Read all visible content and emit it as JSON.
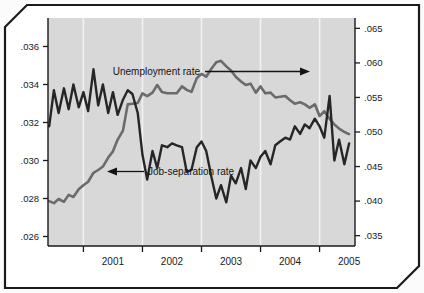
{
  "chart_data": {
    "type": "line",
    "title": "",
    "xlabel": "",
    "ylabel": "",
    "grid": "vertical-only",
    "legend_position": "inline-annotations",
    "x_axis": {
      "tick_labels": [
        "2001",
        "2002",
        "2003",
        "2004",
        "2005"
      ],
      "range_start": "2000.4",
      "range_end": "2005.6"
    },
    "left_axis": {
      "label": "Job-separation rate",
      "tick_labels": [
        ".026",
        ".028",
        ".030",
        ".032",
        ".034",
        ".036"
      ],
      "ylim": [
        0.0255,
        0.0375
      ]
    },
    "right_axis": {
      "label": "Unemployment rate",
      "tick_labels": [
        ".035",
        ".040",
        ".045",
        ".050",
        ".055",
        ".060",
        ".065"
      ],
      "ylim": [
        0.0335,
        0.0665
      ]
    },
    "annotations": [
      {
        "text": "Unemployment rate",
        "arrow": "right"
      },
      {
        "text": "Job-separation rate",
        "arrow": "left"
      }
    ],
    "series": [
      {
        "name": "Unemployment rate",
        "axis": "right",
        "color": "#6b6b6b",
        "x": [
          2000.42,
          2000.5,
          2000.58,
          2000.67,
          2000.75,
          2000.83,
          2000.92,
          2001.0,
          2001.08,
          2001.17,
          2001.25,
          2001.33,
          2001.42,
          2001.5,
          2001.58,
          2001.67,
          2001.75,
          2001.83,
          2001.92,
          2002.0,
          2002.08,
          2002.17,
          2002.25,
          2002.33,
          2002.42,
          2002.5,
          2002.58,
          2002.67,
          2002.75,
          2002.83,
          2002.92,
          2003.0,
          2003.08,
          2003.17,
          2003.25,
          2003.33,
          2003.42,
          2003.5,
          2003.58,
          2003.67,
          2003.75,
          2003.83,
          2003.92,
          2004.0,
          2004.08,
          2004.17,
          2004.25,
          2004.33,
          2004.42,
          2004.5,
          2004.58,
          2004.67,
          2004.75,
          2004.83,
          2004.92,
          2005.0,
          2005.08,
          2005.17,
          2005.25,
          2005.33,
          2005.42,
          2005.5
        ],
        "values": [
          0.04,
          0.0397,
          0.0403,
          0.0399,
          0.0409,
          0.0406,
          0.0417,
          0.0423,
          0.0428,
          0.0441,
          0.0445,
          0.045,
          0.0463,
          0.0472,
          0.0489,
          0.0502,
          0.054,
          0.0541,
          0.0542,
          0.0556,
          0.0552,
          0.0557,
          0.0568,
          0.0558,
          0.0556,
          0.0556,
          0.0556,
          0.0566,
          0.0561,
          0.0558,
          0.0578,
          0.0584,
          0.058,
          0.0592,
          0.0601,
          0.0603,
          0.0595,
          0.0589,
          0.058,
          0.0573,
          0.0568,
          0.057,
          0.0557,
          0.0566,
          0.0556,
          0.0557,
          0.055,
          0.0551,
          0.0552,
          0.0546,
          0.0541,
          0.0543,
          0.054,
          0.0535,
          0.054,
          0.0523,
          0.053,
          0.0519,
          0.0511,
          0.0505,
          0.05,
          0.0497
        ]
      },
      {
        "name": "Job-separation rate",
        "axis": "left",
        "color": "#262626",
        "x": [
          2000.42,
          2000.5,
          2000.58,
          2000.67,
          2000.75,
          2000.83,
          2000.92,
          2001.0,
          2001.08,
          2001.17,
          2001.25,
          2001.33,
          2001.42,
          2001.5,
          2001.58,
          2001.67,
          2001.75,
          2001.83,
          2001.92,
          2002.0,
          2002.08,
          2002.17,
          2002.25,
          2002.33,
          2002.42,
          2002.5,
          2002.58,
          2002.67,
          2002.75,
          2002.83,
          2002.92,
          2003.0,
          2003.08,
          2003.17,
          2003.25,
          2003.33,
          2003.42,
          2003.5,
          2003.58,
          2003.67,
          2003.75,
          2003.83,
          2003.92,
          2004.0,
          2004.08,
          2004.17,
          2004.25,
          2004.33,
          2004.42,
          2004.5,
          2004.58,
          2004.67,
          2004.75,
          2004.83,
          2004.92,
          2005.0,
          2005.08,
          2005.17,
          2005.25,
          2005.33,
          2005.42,
          2005.5
        ],
        "values": [
          0.0318,
          0.0337,
          0.0325,
          0.0338,
          0.0327,
          0.034,
          0.0328,
          0.0336,
          0.0326,
          0.0348,
          0.0329,
          0.034,
          0.0325,
          0.0336,
          0.0324,
          0.0332,
          0.0337,
          0.0335,
          0.0325,
          0.0303,
          0.029,
          0.0305,
          0.0296,
          0.0308,
          0.0307,
          0.0309,
          0.0308,
          0.0307,
          0.0294,
          0.0295,
          0.0307,
          0.031,
          0.0305,
          0.0291,
          0.028,
          0.0287,
          0.0278,
          0.0292,
          0.0288,
          0.0296,
          0.0285,
          0.03,
          0.0296,
          0.0302,
          0.0305,
          0.0298,
          0.0308,
          0.031,
          0.0312,
          0.0311,
          0.0318,
          0.0314,
          0.0319,
          0.0317,
          0.0322,
          0.0318,
          0.0312,
          0.0334,
          0.03,
          0.0311,
          0.0298,
          0.0309
        ]
      }
    ]
  },
  "figure": {
    "plot_bg_color": "#d8d8d8",
    "gridline_color": "#f2f2f2",
    "frame_color": "#1a1a1a"
  }
}
